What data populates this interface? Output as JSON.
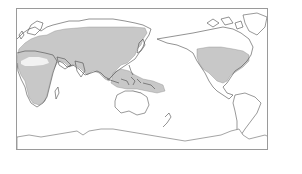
{
  "map": {
    "projection": "equirectangular, Pacific-centered",
    "frame": {
      "border_color": "#9a9a9a",
      "background": "#ffffff"
    },
    "style": {
      "coastline_color": "#555555",
      "range_fill": "#c8c8c8",
      "range_edge": "#8a8a8a",
      "excluded_area_fill": "#f2f2f2"
    },
    "shaded_regions": [
      {
        "name": "Eurasia range",
        "description": "Europe, Middle East, temperate and southern Asia"
      },
      {
        "name": "Africa range",
        "description": "Most of Africa excluding central Sahara"
      },
      {
        "name": "Southeast Asia and Indo-Pacific range",
        "description": "Indochina, Indonesia, Philippines, New Guinea, Pacific islands"
      },
      {
        "name": "Northern Australia range",
        "description": "Northern coast of Australia"
      },
      {
        "name": "North America range",
        "description": "Southern Canada, United States, northern Mexico"
      }
    ],
    "excluded_regions": [
      {
        "name": "Sahara",
        "description": "Unshaded interior of northern Africa"
      }
    ]
  }
}
